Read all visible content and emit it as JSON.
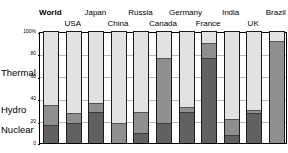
{
  "chart_data": {
    "type": "bar",
    "subtype": "100% stacked bar",
    "title": "",
    "xlabel": "",
    "ylabel": "",
    "ylim": [
      0,
      100
    ],
    "yticks": [
      "0",
      "20",
      "40",
      "60",
      "80",
      "100%"
    ],
    "ytick_values": [
      0,
      20,
      40,
      60,
      80,
      100
    ],
    "grid": true,
    "legend_position": "left-axis-labels",
    "categories": [
      "World",
      "USA",
      "Japan",
      "China",
      "Russia",
      "Canada",
      "Germany",
      "France",
      "India",
      "UK",
      "Brazil"
    ],
    "series": [
      {
        "name": "Nuclear",
        "color": "#616161",
        "values": [
          17,
          19,
          29,
          1,
          10,
          19,
          29,
          77,
          8,
          28,
          1
        ]
      },
      {
        "name": "Hydro",
        "color": "#8f8f8f",
        "values": [
          18,
          9,
          8,
          18,
          19,
          58,
          4,
          13,
          14,
          2,
          91
        ]
      },
      {
        "name": "Thermal",
        "color": "#e2e2e2",
        "values": [
          65,
          72,
          63,
          81,
          71,
          23,
          67,
          10,
          78,
          70,
          8
        ]
      }
    ],
    "side_labels": [
      {
        "key": "thermal",
        "text": "Thermal"
      },
      {
        "key": "hydro",
        "text": "Hydro"
      },
      {
        "key": "nuclear",
        "text": "Nuclear"
      }
    ],
    "label_rows": {
      "top": [
        "World",
        "Japan",
        "Russia",
        "Germany",
        "India",
        "Brazil"
      ],
      "bottom": [
        "USA",
        "China",
        "Canada",
        "France",
        "UK"
      ]
    },
    "bold_categories": [
      "World"
    ]
  }
}
